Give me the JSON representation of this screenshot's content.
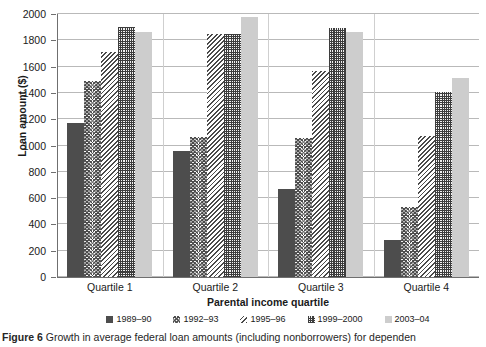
{
  "chart_data": {
    "type": "bar",
    "title": "",
    "xlabel": "Parental income quartile",
    "ylabel": "Loan amount ($)",
    "ylim": [
      0,
      2000
    ],
    "ytick_step": 200,
    "yticks": [
      0,
      200,
      400,
      600,
      800,
      1000,
      1200,
      1400,
      1600,
      1800,
      2000
    ],
    "grid": true,
    "legend_position": "bottom",
    "categories": [
      "Quartile 1",
      "Quartile 2",
      "Quartile 3",
      "Quartile 4"
    ],
    "series": [
      {
        "name": "1989–90",
        "pattern": "solid-dark",
        "values": [
          1175,
          955,
          670,
          285
        ]
      },
      {
        "name": "1992–93",
        "pattern": "chevron",
        "values": [
          1490,
          1065,
          1060,
          530
        ]
      },
      {
        "name": "1995–96",
        "pattern": "diagonal",
        "values": [
          1710,
          1850,
          1570,
          1070
        ]
      },
      {
        "name": "1999–2000",
        "pattern": "checker",
        "values": [
          1900,
          1850,
          1890,
          1410
        ]
      },
      {
        "name": "2003–04",
        "pattern": "light",
        "values": [
          1860,
          1975,
          1860,
          1510
        ]
      }
    ]
  },
  "caption": {
    "label": "Figure 6",
    "text": "Growth in average federal loan amounts (including nonborrowers) for dependen"
  }
}
